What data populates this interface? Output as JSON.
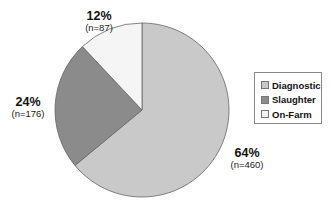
{
  "chart_data": {
    "type": "pie",
    "title": "",
    "categories": [
      "Diagnostic",
      "Slaughter",
      "On-Farm"
    ],
    "values": [
      64,
      24,
      12
    ],
    "counts": [
      460,
      176,
      87
    ],
    "labels": [
      {
        "pct": "64%",
        "count": "(n=460)"
      },
      {
        "pct": "24%",
        "count": "(n=176)"
      },
      {
        "pct": "12%",
        "count": "(n=87)"
      }
    ],
    "colors": [
      "#c9c9c9",
      "#8b8b8b",
      "#f5f5f5"
    ],
    "start_angle_deg": 0,
    "direction": "clockwise",
    "legend_position": "right"
  },
  "legend": {
    "items": [
      {
        "label": "Diagnostic",
        "color": "#c9c9c9"
      },
      {
        "label": "Slaughter",
        "color": "#8b8b8b"
      },
      {
        "label": "On-Farm",
        "color": "#f5f5f5"
      }
    ]
  }
}
